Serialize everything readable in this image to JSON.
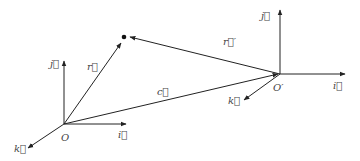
{
  "diagram": {
    "type": "vector-diagram",
    "stroke_color": "#222222",
    "label_color": "#444444",
    "frames": [
      {
        "origin_label": "O",
        "origin": [
          64,
          124
        ],
        "axes": {
          "i": {
            "label": "i⃗",
            "end": [
              126,
              124
            ]
          },
          "j": {
            "label": "j⃗",
            "end": [
              64,
              60
            ]
          },
          "k": {
            "label": "k⃗",
            "end": [
              28,
              148
            ]
          }
        }
      },
      {
        "origin_label": "O′",
        "origin": [
          280,
          74
        ],
        "axes": {
          "i": {
            "label": "i⃗",
            "end": [
              345,
              74
            ]
          },
          "j": {
            "label": "j⃗",
            "end": [
              280,
              10
            ]
          },
          "k": {
            "label": "k⃗",
            "end": [
              244,
              100
            ]
          }
        }
      }
    ],
    "point": {
      "position": [
        124,
        38
      ]
    },
    "vectors": [
      {
        "label": "r⃗",
        "from": "O",
        "to": "point"
      },
      {
        "label": "r⃗′",
        "from": "O′",
        "to": "point"
      },
      {
        "label": "c⃗",
        "from": "O",
        "to": "O′"
      }
    ]
  },
  "labels": {
    "origin_o": "O",
    "origin_o_prime": "O′",
    "o_i": "i⃗",
    "o_j": "j⃗",
    "o_k": "k⃗",
    "op_i": "i⃗",
    "op_j": "j⃗",
    "op_k": "k⃗",
    "vec_r": "r⃗",
    "vec_r_prime": "r⃗′",
    "vec_c": "c⃗"
  }
}
